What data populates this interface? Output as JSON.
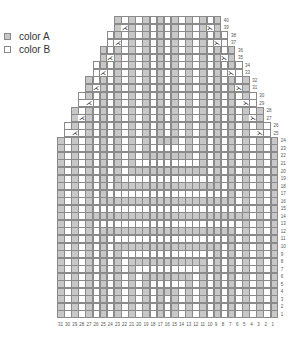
{
  "legend": [
    {
      "label": "color A",
      "color": "#c8c8c8"
    },
    {
      "label": "color B",
      "color": "#ffffff"
    }
  ],
  "chart": {
    "type": "knitting-chart",
    "stitches": 31,
    "rows": 40,
    "grid_left": 57,
    "grid_top": 16,
    "cell_w": 7.12,
    "cell_h": 7.55,
    "full_width_rows": 24,
    "shaping": "decrease 1 stitch each side every 2nd row from row 25; decrease worked on odd rows 25-39",
    "decrease_symbol_left": "⋌",
    "decrease_symbol_right": "⋋",
    "column_labels": [
      31,
      30,
      29,
      28,
      27,
      26,
      25,
      24,
      23,
      22,
      21,
      20,
      19,
      18,
      17,
      16,
      15,
      14,
      13,
      12,
      11,
      10,
      9,
      8,
      7,
      6,
      5,
      4,
      3,
      2,
      1
    ],
    "row_labels": [
      1,
      2,
      3,
      4,
      5,
      6,
      7,
      8,
      9,
      10,
      11,
      12,
      13,
      14,
      15,
      16,
      17,
      18,
      19,
      20,
      21,
      22,
      23,
      24,
      25,
      26,
      27,
      28,
      29,
      30,
      31,
      32,
      33,
      34,
      35,
      36,
      37,
      38,
      39,
      40
    ],
    "color_a": "#c8c8c8",
    "color_b": "#ffffff",
    "grid_line": "#8a8a8a"
  }
}
